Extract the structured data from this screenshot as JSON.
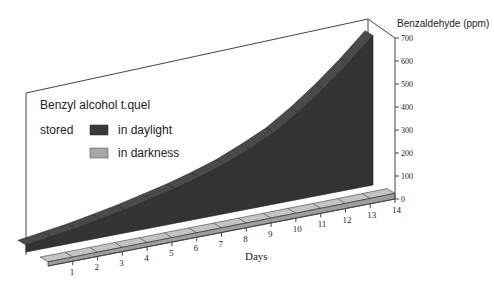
{
  "chart_data": {
    "type": "area",
    "subtype": "3d-ribbon",
    "title": "",
    "xlabel": "Days",
    "ylabel": "Benzaldehyde (ppm)",
    "x": [
      0,
      1,
      2,
      3,
      4,
      5,
      6,
      7,
      8,
      9,
      10,
      11,
      12,
      13,
      14
    ],
    "xticks": [
      "1",
      "2",
      "3",
      "4",
      "5",
      "6",
      "7",
      "8",
      "9",
      "10",
      "11",
      "12",
      "13",
      "14"
    ],
    "yticks": [
      "0",
      "100",
      "200",
      "300",
      "400",
      "500",
      "600",
      "700"
    ],
    "ylim": [
      0,
      700
    ],
    "grid": false,
    "legend": {
      "title_line1": "Benzyl alcohol t.quel",
      "title_line2": "stored",
      "position": "upper-left",
      "entries": [
        {
          "label": "in daylight",
          "color": "#3a3a3a"
        },
        {
          "label": "in darkness",
          "color": "#a8a8a8"
        }
      ]
    },
    "series": [
      {
        "name": "in daylight",
        "color": "#3a3a3a",
        "values": [
          30,
          45,
          60,
          80,
          100,
          125,
          150,
          180,
          215,
          260,
          310,
          380,
          460,
          550,
          650
        ]
      },
      {
        "name": "in darkness",
        "color": "#a8a8a8",
        "values": [
          40,
          40,
          41,
          42,
          42,
          43,
          44,
          45,
          46,
          47,
          48,
          49,
          50,
          52,
          55
        ]
      }
    ]
  }
}
